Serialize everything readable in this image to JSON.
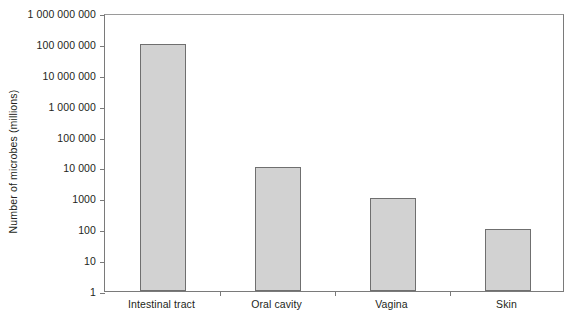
{
  "chart_data": {
    "type": "bar",
    "title": "",
    "xlabel": "",
    "ylabel": "Number of microbes (millions)",
    "yscale": "log",
    "ylim": [
      1,
      1000000000
    ],
    "grid": false,
    "legend": null,
    "categories": [
      "Intestinal tract",
      "Oral cavity",
      "Vagina",
      "Skin"
    ],
    "values": [
      100000000,
      10000,
      1000,
      100
    ],
    "ytick_labels": [
      "1 000 000 000",
      "100 000 000",
      "10 000 000",
      "1 000 000",
      "100 000",
      "10 000",
      "1000",
      "100",
      "10",
      "1"
    ],
    "ytick_values": [
      1000000000,
      100000000,
      10000000,
      1000000,
      100000,
      10000,
      1000,
      100,
      10,
      1
    ],
    "bar_color": "#d2d2d2",
    "bar_edge_color": "#6f6f6f",
    "axis_color": "#7a7a7a"
  }
}
